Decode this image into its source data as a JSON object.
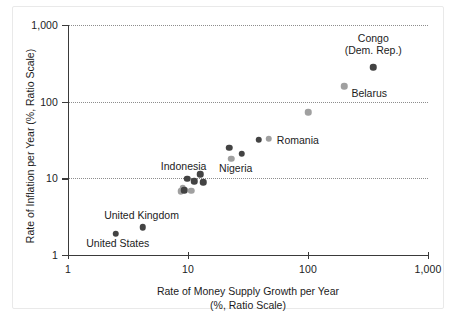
{
  "chart_data": {
    "type": "scatter",
    "title": "",
    "xlabel": "Rate of Money Supply Growth per Year",
    "xlabel_sub": "(%, Ratio Scale)",
    "ylabel": "Rate of Inflation per Year (%, Ratio Scale)",
    "xscale": "log",
    "yscale": "log",
    "xlim": [
      1,
      1000
    ],
    "ylim": [
      1,
      1000
    ],
    "grid": "horizontal-dotted",
    "legend": "none",
    "xticks": [
      {
        "value": 1,
        "label": "1"
      },
      {
        "value": 10,
        "label": "10"
      },
      {
        "value": 100,
        "label": "100"
      },
      {
        "value": 1000,
        "label": "1,000"
      }
    ],
    "yticks": [
      {
        "value": 1,
        "label": "1"
      },
      {
        "value": 10,
        "label": "10"
      },
      {
        "value": 100,
        "label": "100"
      },
      {
        "value": 1000,
        "label": "1,000"
      }
    ],
    "colors": {
      "dark_marker": "#434343",
      "light_marker": "#a0a0a0",
      "axis": "#3a3a3a",
      "gridline": "#8d8d8d",
      "background": "#ffffff"
    },
    "points": [
      {
        "name": "United States",
        "x": 2.5,
        "y": 1.9,
        "shade": "dark"
      },
      {
        "name": "United Kingdom",
        "x": 4.2,
        "y": 2.3,
        "shade": "dark"
      },
      {
        "name": "",
        "x": 8.7,
        "y": 6.8,
        "shade": "light"
      },
      {
        "name": "",
        "x": 9.0,
        "y": 7.5,
        "shade": "light"
      },
      {
        "name": "",
        "x": 9.3,
        "y": 7.0,
        "shade": "dark"
      },
      {
        "name": "",
        "x": 9.9,
        "y": 9.9,
        "shade": "dark"
      },
      {
        "name": "",
        "x": 10.6,
        "y": 6.9,
        "shade": "light"
      },
      {
        "name": "",
        "x": 11.3,
        "y": 9.1,
        "shade": "dark"
      },
      {
        "name": "",
        "x": 12.6,
        "y": 11.3,
        "shade": "dark"
      },
      {
        "name": "",
        "x": 13.4,
        "y": 8.9,
        "shade": "dark"
      },
      {
        "name": "",
        "x": 22.0,
        "y": 25.0,
        "shade": "dark"
      },
      {
        "name": "",
        "x": 23.0,
        "y": 18.0,
        "shade": "light"
      },
      {
        "name": "",
        "x": 28.0,
        "y": 21.0,
        "shade": "dark"
      },
      {
        "name": "",
        "x": 39.0,
        "y": 32.0,
        "shade": "dark"
      },
      {
        "name": "Romania",
        "x": 47.0,
        "y": 33.0,
        "shade": "light"
      },
      {
        "name": "",
        "x": 100.0,
        "y": 73.0,
        "shade": "light"
      },
      {
        "name": "Belarus",
        "x": 200.0,
        "y": 160.0,
        "shade": "light"
      },
      {
        "name": "Congo (Dem. Rep.)",
        "x": 350.0,
        "y": 280.0,
        "shade": "dark"
      }
    ],
    "annotations": [
      {
        "id": "congo",
        "lines": [
          "Congo",
          "(Dem. Rep.)"
        ],
        "x": 350.0,
        "y": 560.0,
        "align": "center"
      },
      {
        "id": "belarus",
        "lines": [
          "Belarus"
        ],
        "x": 230.0,
        "y": 128.0,
        "align": "left"
      },
      {
        "id": "romania",
        "lines": [
          "Romania"
        ],
        "x": 55.0,
        "y": 31.0,
        "align": "left"
      },
      {
        "id": "nigeria",
        "lines": [
          "Nigeria"
        ],
        "x": 25.0,
        "y": 13.5,
        "align": "center"
      },
      {
        "id": "indonesia",
        "lines": [
          "Indonesia"
        ],
        "x": 9.2,
        "y": 14.5,
        "align": "center"
      },
      {
        "id": "united-kingdom",
        "lines": [
          "United Kingdom"
        ],
        "x": 4.1,
        "y": 3.3,
        "align": "center"
      },
      {
        "id": "united-states",
        "lines": [
          "United States"
        ],
        "x": 2.6,
        "y": 1.42,
        "align": "center"
      }
    ]
  }
}
